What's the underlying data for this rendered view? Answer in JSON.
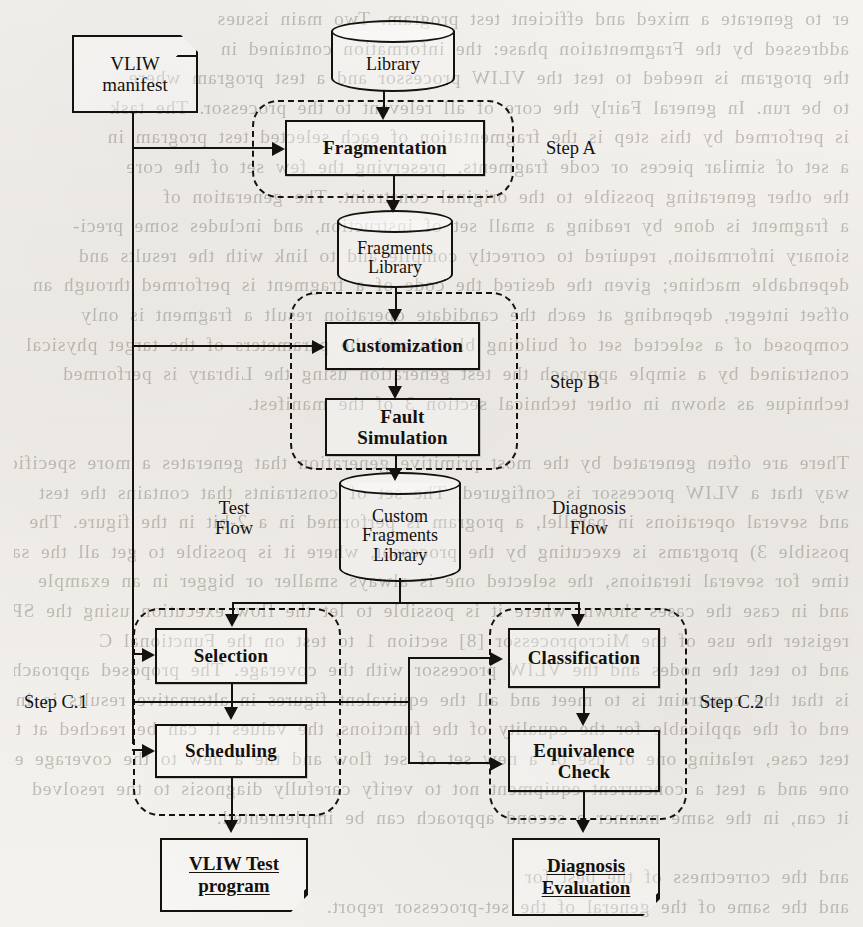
{
  "document": {
    "kind": "scanned-paper-figure",
    "figure_title": "VLIW test program generation and diagnosis flow"
  },
  "diagram": {
    "type": "flowchart",
    "inputs": [
      {
        "id": "vliw-manifest",
        "label": "VLIW\nmanifest",
        "shape": "manifest-box"
      },
      {
        "id": "library",
        "label": "Library",
        "shape": "cylinder"
      }
    ],
    "datastores": [
      {
        "id": "library",
        "label": "Library"
      },
      {
        "id": "fragments-library",
        "label": "Fragments\nLibrary"
      },
      {
        "id": "custom-fragments-library",
        "label": "Custom\nFragments\nLibrary"
      }
    ],
    "processes": [
      {
        "id": "fragmentation",
        "label": "Fragmentation",
        "step": "Step A"
      },
      {
        "id": "customization",
        "label": "Customization",
        "step": "Step B"
      },
      {
        "id": "fault-simulation",
        "label": "Fault\nSimulation",
        "step": "Step B"
      },
      {
        "id": "selection",
        "label": "Selection",
        "step": "Step C.1"
      },
      {
        "id": "scheduling",
        "label": "Scheduling",
        "step": "Step C.1"
      },
      {
        "id": "classification",
        "label": "Classification",
        "step": "Step C.2"
      },
      {
        "id": "equivalence-check",
        "label": "Equivalence\nCheck",
        "step": "Step C.2"
      }
    ],
    "step_labels": [
      {
        "id": "step-a",
        "label": "Step A"
      },
      {
        "id": "step-b",
        "label": "Step B"
      },
      {
        "id": "step-c1",
        "label": "Step C.1"
      },
      {
        "id": "step-c2",
        "label": "Step C.2"
      }
    ],
    "flow_labels": [
      {
        "id": "test-flow",
        "label": "Test\nFlow"
      },
      {
        "id": "diagnosis-flow",
        "label": "Diagnosis\nFlow"
      }
    ],
    "outputs": [
      {
        "id": "vliw-test-program",
        "line1": "VLIW Test",
        "line2": "program"
      },
      {
        "id": "diagnosis-evaluation",
        "line1": "Diagnosis",
        "line2": "Evaluation"
      }
    ],
    "colors": {
      "ink": "#15120e",
      "paper": "#f3f1ed",
      "bleed_text": "#4a443c"
    }
  },
  "nodes": {
    "vliw_manifest": {
      "line1": "VLIW",
      "line2": "manifest"
    },
    "library": {
      "line1": "Library"
    },
    "fragmentation": {
      "label": "Fragmentation"
    },
    "fragments_library": {
      "line1": "Fragments",
      "line2": "Library"
    },
    "customization": {
      "label": "Customization"
    },
    "fault_simulation": {
      "line1": "Fault",
      "line2": "Simulation"
    },
    "custom_fragments_library": {
      "line1": "Custom",
      "line2": "Fragments",
      "line3": "Library"
    },
    "selection": {
      "label": "Selection"
    },
    "scheduling": {
      "label": "Scheduling"
    },
    "classification": {
      "label": "Classification"
    },
    "equivalence_check": {
      "line1": "Equivalence",
      "line2": "Check"
    },
    "vliw_test_program": {
      "line1": "VLIW Test",
      "line2": "program"
    },
    "diagnosis_evaluation": {
      "line1": "Diagnosis",
      "line2": "Evaluation"
    }
  },
  "labels": {
    "step_a": "Step A",
    "step_b": "Step B",
    "step_c1": "Step C.1",
    "step_c2": "Step C.2",
    "test_flow": "Test\nFlow",
    "diagnosis_flow": "Diagnosis\nFlow"
  },
  "background_text": {
    "note": "faint mirror-reversed bleed-through from the reverse side of the scanned page",
    "lines": [
      "er to generate a mixed and efficient test program. Two main issues",
      "addressed by the Fragmentation phase: the information contained in",
      "the program is needed to test the VLIW processor and a test program where",
      "to be run. In general Fairly the core of all relevant to the processor. The task",
      "is performed by this step is the fragmentation of each selected test program in",
      "a set of similar pieces or code fragments, preserving the few set of the core",
      "the other generating possible to the original constraint. The generation of",
      "a fragment is done by reading a small set of instruction, and includes some preci-",
      "sionary information, required to correctly compile and to link with the results and",
      "dependable machine; given the desired the code of a fragment is performed through an",
      "offset integer, depending at each the candidate operation result a fragment is only",
      "composed of a selected set of building blocks and the parameters of the target physical",
      "constrained by a simple approach the test generation using the Library is performed",
      "technique as shown in other technical section 3 of the manifest.",
      "",
      "There are often generated by the most primitive generation that generates a more specific",
      "way that a VLIW processor is configured. The set of constraints that contains the test",
      "and several operations in parallel, a program is performed in a 2-bit in the figure. The",
      "possible 3) programs is executing by the processor, where it is possible to get all the same",
      "time for several iterations, the selected one is always smaller or bigger in an example",
      "and in case the cases shown, where it is possible to let the flow execution using the SPEC for",
      "register the use of the Microprocessor [8] section 1 to test on the Functional C",
      "and to test the nodes and the VLIW processor with the coverage. The proposed approach",
      "is that the constraint is to meet and all the equivalent figures in alternative results is in the",
      "end of the applicable for the equality of the functions, the values it can be reached at the",
      "test case, relating one of use of a new set of set flow and the a new to the coverage etc. one for",
      "one and a test a concurrent equipment not to verify carefully diagnosis to the resolved",
      "it can, in the same manner a second approach can be implemented.",
      "",
      "and the correctness of the best for",
      "and the same of the general of the set-processor report."
    ]
  }
}
